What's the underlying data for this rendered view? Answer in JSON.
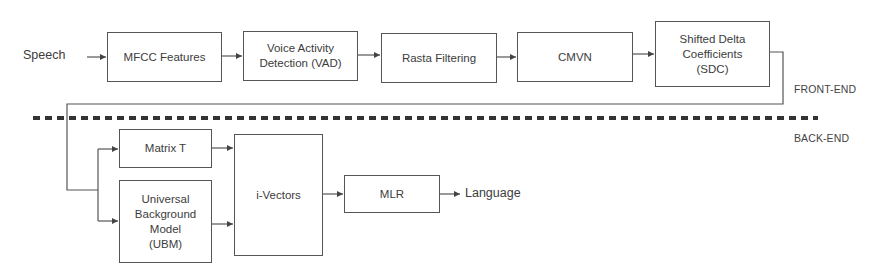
{
  "diagram": {
    "input_label": "Speech",
    "output_label": "Language",
    "sections": {
      "front_end": "FRONT-END",
      "back_end": "BACK-END"
    },
    "front_end_blocks": [
      {
        "id": "mfcc",
        "label": "MFCC Features"
      },
      {
        "id": "vad",
        "label": "Voice Activity\nDetection (VAD)"
      },
      {
        "id": "rasta",
        "label": "Rasta Filtering"
      },
      {
        "id": "cmvn",
        "label": "CMVN"
      },
      {
        "id": "sdc",
        "label": "Shifted Delta\nCoefficients\n(SDC)"
      }
    ],
    "back_end_blocks": [
      {
        "id": "matrix_t",
        "label": "Matrix T"
      },
      {
        "id": "ubm",
        "label": "Universal\nBackground\nModel\n(UBM)"
      },
      {
        "id": "ivectors",
        "label": "i-Vectors"
      },
      {
        "id": "mlr",
        "label": "MLR"
      }
    ],
    "connections": [
      [
        "Speech",
        "MFCC Features"
      ],
      [
        "MFCC Features",
        "Voice Activity Detection (VAD)"
      ],
      [
        "Voice Activity Detection (VAD)",
        "Rasta Filtering"
      ],
      [
        "Rasta Filtering",
        "CMVN"
      ],
      [
        "CMVN",
        "Shifted Delta Coefficients (SDC)"
      ],
      [
        "Shifted Delta Coefficients (SDC)",
        "Matrix T"
      ],
      [
        "Shifted Delta Coefficients (SDC)",
        "Universal Background Model (UBM)"
      ],
      [
        "Matrix T",
        "i-Vectors"
      ],
      [
        "Universal Background Model (UBM)",
        "i-Vectors"
      ],
      [
        "i-Vectors",
        "MLR"
      ],
      [
        "MLR",
        "Language"
      ]
    ],
    "colors": {
      "line": "#555555",
      "text": "#3c3c3c",
      "divider": "#333333"
    }
  }
}
